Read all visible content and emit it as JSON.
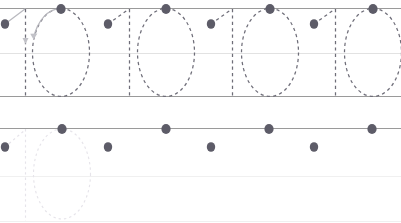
{
  "worksheet": {
    "title": "Number tracing practice worksheet",
    "pattern": "10",
    "colors": {
      "rule_line": "#9a9a9a",
      "rule_line_mid": "#e2e2e2",
      "trace_stroke": "#6e6d78",
      "trace_stroke_faint": "#e6e4ea",
      "guide_stroke": "#b9b9bf",
      "start_dot": "#5d5c68",
      "background": "#ffffff"
    },
    "rows": [
      {
        "name": "row-traced",
        "top_line_y": 8,
        "mid_line_y": 53,
        "baseline_y": 96,
        "style": "dashed",
        "glyphs": [
          {
            "char": "1",
            "index": 0,
            "stem_x": 25,
            "dot_x": 5,
            "dot_y": 24,
            "has_guide_stroke": true,
            "has_arrow": true
          },
          {
            "char": "0",
            "index": 1,
            "center_x": 61,
            "dot_x": 61,
            "dot_y": 9,
            "has_guide_stroke": true,
            "has_arrow": true
          },
          {
            "char": "1",
            "index": 2,
            "stem_x": 129,
            "dot_x": 108,
            "dot_y": 24,
            "has_guide_stroke": false,
            "has_arrow": false
          },
          {
            "char": "0",
            "index": 3,
            "center_x": 166,
            "dot_x": 166,
            "dot_y": 9,
            "has_guide_stroke": false,
            "has_arrow": false
          },
          {
            "char": "1",
            "index": 4,
            "stem_x": 232,
            "dot_x": 211,
            "dot_y": 24,
            "has_guide_stroke": false,
            "has_arrow": false
          },
          {
            "char": "0",
            "index": 5,
            "center_x": 270,
            "dot_x": 270,
            "dot_y": 9,
            "has_guide_stroke": false,
            "has_arrow": false
          },
          {
            "char": "1",
            "index": 6,
            "stem_x": 335,
            "dot_x": 314,
            "dot_y": 24,
            "has_guide_stroke": false,
            "has_arrow": false
          },
          {
            "char": "0",
            "index": 7,
            "center_x": 373,
            "dot_x": 373,
            "dot_y": 9,
            "has_guide_stroke": false,
            "has_arrow": false
          }
        ]
      },
      {
        "name": "row-blank-practice",
        "top_line_y": 128,
        "mid_line_y": 176,
        "baseline_y": 221,
        "style": "dots-only",
        "glyphs": [
          {
            "char": "1",
            "index": 0,
            "stem_x": 25,
            "dot_x": 5,
            "dot_y": 147,
            "has_guide_stroke": false,
            "has_arrow": false
          },
          {
            "char": "0",
            "index": 1,
            "center_x": 62,
            "dot_x": 62,
            "dot_y": 129,
            "has_guide_stroke": false,
            "has_arrow": false,
            "faint_outline": true
          },
          {
            "char": "1",
            "index": 2,
            "stem_x": 129,
            "dot_x": 108,
            "dot_y": 147,
            "has_guide_stroke": false,
            "has_arrow": false
          },
          {
            "char": "0",
            "index": 3,
            "center_x": 166,
            "dot_x": 166,
            "dot_y": 129,
            "has_guide_stroke": false,
            "has_arrow": false
          },
          {
            "char": "1",
            "index": 4,
            "stem_x": 232,
            "dot_x": 211,
            "dot_y": 147,
            "has_guide_stroke": false,
            "has_arrow": false
          },
          {
            "char": "0",
            "index": 5,
            "center_x": 269,
            "dot_x": 269,
            "dot_y": 129,
            "has_guide_stroke": false,
            "has_arrow": false
          },
          {
            "char": "1",
            "index": 6,
            "stem_x": 335,
            "dot_x": 314,
            "dot_y": 147,
            "has_guide_stroke": false,
            "has_arrow": false
          },
          {
            "char": "0",
            "index": 7,
            "center_x": 372,
            "dot_x": 372,
            "dot_y": 129,
            "has_guide_stroke": false,
            "has_arrow": false
          }
        ]
      }
    ]
  }
}
